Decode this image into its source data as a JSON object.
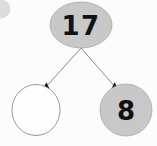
{
  "diagram": {
    "type": "number-bond",
    "background_color": "#fdfdfd",
    "node_fill_color": "#c9c9c9",
    "node_stroke_color": "#a9a9a9",
    "empty_node_fill_color": "#ffffff",
    "empty_node_stroke_color": "#8d8d8d",
    "connector_color": "#8a8a8a",
    "arrowhead_color": "#15151a",
    "nodes": [
      {
        "id": "whole",
        "role": "total",
        "label": "17",
        "filled": true,
        "empty": false,
        "shape": "ellipse",
        "cx": 81,
        "cy": 25,
        "rx": 31,
        "ry": 23,
        "font_size": 26
      },
      {
        "id": "part-left",
        "role": "missing-addend",
        "label": "",
        "filled": false,
        "empty": true,
        "shape": "circle",
        "cx": 36,
        "cy": 110,
        "rx": 24,
        "ry": 25,
        "font_size": 24
      },
      {
        "id": "part-right",
        "role": "known-addend",
        "label": "8",
        "filled": true,
        "empty": false,
        "shape": "circle",
        "cx": 126,
        "cy": 110,
        "rx": 26,
        "ry": 26,
        "font_size": 26
      }
    ],
    "connectors": [
      {
        "id": "branch-left",
        "from": "whole",
        "to": "part-left",
        "x1": 81,
        "y1": 48,
        "x2": 45,
        "y2": 88,
        "arrow_angle": 132
      },
      {
        "id": "branch-right",
        "from": "whole",
        "to": "part-right",
        "x1": 81,
        "y1": 48,
        "x2": 116,
        "y2": 88,
        "arrow_angle": 48
      }
    ],
    "artifact": {
      "id": "corner-smudge",
      "cx": 1,
      "cy": 9,
      "r": 9
    }
  }
}
